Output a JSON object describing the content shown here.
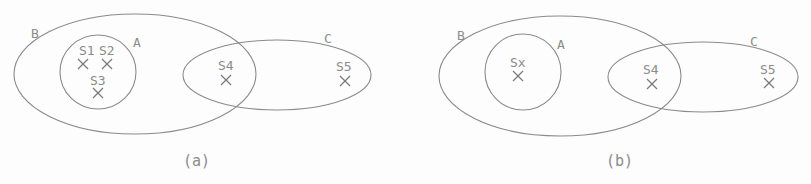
{
  "panels": [
    {
      "caption": "(a)",
      "sets": [
        {
          "label": "B",
          "shape": "ellipse",
          "cx": 135,
          "cy": 74,
          "rx": 121,
          "ry": 60,
          "label_x": 31,
          "label_y": 38
        },
        {
          "label": "A",
          "shape": "circle",
          "cx": 98,
          "cy": 72,
          "rx": 38,
          "ry": 37,
          "label_x": 133,
          "label_y": 47
        },
        {
          "label": "C",
          "shape": "ellipse",
          "cx": 277,
          "cy": 75,
          "rx": 94,
          "ry": 35,
          "label_x": 324,
          "label_y": 43
        }
      ],
      "points": [
        {
          "label": "S1",
          "label_x": 79,
          "label_y": 55,
          "x": 83,
          "y": 64
        },
        {
          "label": "S2",
          "label_x": 99,
          "label_y": 55,
          "x": 107,
          "y": 64
        },
        {
          "label": "S3",
          "label_x": 90,
          "label_y": 85,
          "x": 98,
          "y": 93
        },
        {
          "label": "S4",
          "label_x": 218,
          "label_y": 70,
          "x": 226,
          "y": 80
        },
        {
          "label": "S5",
          "label_x": 336,
          "label_y": 71,
          "x": 345,
          "y": 81
        }
      ],
      "caption_x": 183,
      "caption_y": 166
    },
    {
      "caption": "(b)",
      "sets": [
        {
          "label": "B",
          "shape": "ellipse",
          "cx": 560,
          "cy": 76,
          "rx": 121,
          "ry": 60,
          "label_x": 457,
          "label_y": 40
        },
        {
          "label": "A",
          "shape": "circle",
          "cx": 523,
          "cy": 72,
          "rx": 38,
          "ry": 38,
          "label_x": 557,
          "label_y": 49
        },
        {
          "label": "C",
          "shape": "ellipse",
          "cx": 703,
          "cy": 77,
          "rx": 95,
          "ry": 35,
          "label_x": 750,
          "label_y": 46
        }
      ],
      "points": [
        {
          "label": "Sx",
          "label_x": 510,
          "label_y": 67,
          "x": 518,
          "y": 76
        },
        {
          "label": "S4",
          "label_x": 643,
          "label_y": 74,
          "x": 652,
          "y": 84
        },
        {
          "label": "S5",
          "label_x": 760,
          "label_y": 74,
          "x": 769,
          "y": 83
        }
      ],
      "caption_x": 606,
      "caption_y": 166
    }
  ],
  "colors": {
    "stroke": "#8a8a8a",
    "text": "#8c8c8c",
    "background": "#fdfdfd"
  }
}
